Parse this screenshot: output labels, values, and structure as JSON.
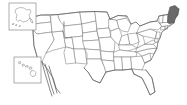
{
  "map": {
    "title": "United States blank outline map",
    "type": "choropleth-outline",
    "projection": "albers-usa",
    "background_color": "#ffffff",
    "default_state_fill": "#ffffff",
    "state_border_color": "#7d7d7d",
    "national_border_color": "#5f5f5f",
    "highlight_fill": "#6a6a6a",
    "highlight_border_color": "#4a4a4a",
    "inset_box_border_color": "#8a8a8a",
    "highlighted_states": [
      "Maine"
    ],
    "labels_visible": false,
    "legend_visible": false,
    "title_visible": false
  },
  "insets": [
    {
      "name": "alaska-inset",
      "label": "Alaska",
      "position": "top-left"
    },
    {
      "name": "hawaii-inset",
      "label": "Hawaii",
      "position": "mid-left"
    }
  ],
  "states": [
    {
      "name": "Washington",
      "abbr": "WA",
      "highlighted": false
    },
    {
      "name": "Oregon",
      "abbr": "OR",
      "highlighted": false
    },
    {
      "name": "California",
      "abbr": "CA",
      "highlighted": false
    },
    {
      "name": "Nevada",
      "abbr": "NV",
      "highlighted": false
    },
    {
      "name": "Idaho",
      "abbr": "ID",
      "highlighted": false
    },
    {
      "name": "Montana",
      "abbr": "MT",
      "highlighted": false
    },
    {
      "name": "Wyoming",
      "abbr": "WY",
      "highlighted": false
    },
    {
      "name": "Utah",
      "abbr": "UT",
      "highlighted": false
    },
    {
      "name": "Arizona",
      "abbr": "AZ",
      "highlighted": false
    },
    {
      "name": "Colorado",
      "abbr": "CO",
      "highlighted": false
    },
    {
      "name": "New Mexico",
      "abbr": "NM",
      "highlighted": false
    },
    {
      "name": "North Dakota",
      "abbr": "ND",
      "highlighted": false
    },
    {
      "name": "South Dakota",
      "abbr": "SD",
      "highlighted": false
    },
    {
      "name": "Nebraska",
      "abbr": "NE",
      "highlighted": false
    },
    {
      "name": "Kansas",
      "abbr": "KS",
      "highlighted": false
    },
    {
      "name": "Oklahoma",
      "abbr": "OK",
      "highlighted": false
    },
    {
      "name": "Texas",
      "abbr": "TX",
      "highlighted": false
    },
    {
      "name": "Minnesota",
      "abbr": "MN",
      "highlighted": false
    },
    {
      "name": "Iowa",
      "abbr": "IA",
      "highlighted": false
    },
    {
      "name": "Missouri",
      "abbr": "MO",
      "highlighted": false
    },
    {
      "name": "Arkansas",
      "abbr": "AR",
      "highlighted": false
    },
    {
      "name": "Louisiana",
      "abbr": "LA",
      "highlighted": false
    },
    {
      "name": "Wisconsin",
      "abbr": "WI",
      "highlighted": false
    },
    {
      "name": "Illinois",
      "abbr": "IL",
      "highlighted": false
    },
    {
      "name": "Michigan",
      "abbr": "MI",
      "highlighted": false
    },
    {
      "name": "Indiana",
      "abbr": "IN",
      "highlighted": false
    },
    {
      "name": "Ohio",
      "abbr": "OH",
      "highlighted": false
    },
    {
      "name": "Kentucky",
      "abbr": "KY",
      "highlighted": false
    },
    {
      "name": "Tennessee",
      "abbr": "TN",
      "highlighted": false
    },
    {
      "name": "Mississippi",
      "abbr": "MS",
      "highlighted": false
    },
    {
      "name": "Alabama",
      "abbr": "AL",
      "highlighted": false
    },
    {
      "name": "Georgia",
      "abbr": "GA",
      "highlighted": false
    },
    {
      "name": "Florida",
      "abbr": "FL",
      "highlighted": false
    },
    {
      "name": "South Carolina",
      "abbr": "SC",
      "highlighted": false
    },
    {
      "name": "North Carolina",
      "abbr": "NC",
      "highlighted": false
    },
    {
      "name": "Virginia",
      "abbr": "VA",
      "highlighted": false
    },
    {
      "name": "West Virginia",
      "abbr": "WV",
      "highlighted": false
    },
    {
      "name": "Maryland",
      "abbr": "MD",
      "highlighted": false
    },
    {
      "name": "Delaware",
      "abbr": "DE",
      "highlighted": false
    },
    {
      "name": "Pennsylvania",
      "abbr": "PA",
      "highlighted": false
    },
    {
      "name": "New Jersey",
      "abbr": "NJ",
      "highlighted": false
    },
    {
      "name": "New York",
      "abbr": "NY",
      "highlighted": false
    },
    {
      "name": "Connecticut",
      "abbr": "CT",
      "highlighted": false
    },
    {
      "name": "Rhode Island",
      "abbr": "RI",
      "highlighted": false
    },
    {
      "name": "Massachusetts",
      "abbr": "MA",
      "highlighted": false
    },
    {
      "name": "Vermont",
      "abbr": "VT",
      "highlighted": false
    },
    {
      "name": "New Hampshire",
      "abbr": "NH",
      "highlighted": false
    },
    {
      "name": "Maine",
      "abbr": "ME",
      "highlighted": true
    },
    {
      "name": "Alaska",
      "abbr": "AK",
      "highlighted": false
    },
    {
      "name": "Hawaii",
      "abbr": "HI",
      "highlighted": false
    }
  ]
}
